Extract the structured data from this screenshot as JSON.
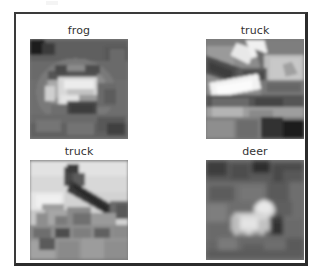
{
  "figure": {
    "background_color": "#ffffff",
    "frame_border_color": "#2b2b2b",
    "layout": "2x2-image-grid",
    "top_artifact": ""
  },
  "grid": {
    "rows": 2,
    "cols": 2,
    "cells": [
      {
        "index": 0,
        "label": "frog",
        "position": "top-left",
        "image_name": "frog-thumbnail",
        "colormap": "gray",
        "mean_gray": "#6f6f6f",
        "description": "low-resolution grayscale frog sitting on pale ground, bright body mass in center"
      },
      {
        "index": 1,
        "label": "truck",
        "position": "top-right",
        "image_name": "truck-thumbnail",
        "colormap": "gray",
        "mean_gray": "#8a8a8a",
        "description": "low-resolution grayscale truck with bright diagonal cab edges and dark wheels"
      },
      {
        "index": 2,
        "label": "truck",
        "position": "bottom-left",
        "image_name": "truck-thumbnail",
        "colormap": "gray",
        "mean_gray": "#9a9a9a",
        "description": "low-resolution grayscale truck with dark diagonal boom arm across bright sky"
      },
      {
        "index": 3,
        "label": "deer",
        "position": "bottom-right",
        "image_name": "deer-thumbnail",
        "colormap": "gray",
        "mean_gray": "#6a6a6a",
        "description": "low-resolution grayscale deer standing, bright body and head against dark foliage"
      }
    ]
  }
}
